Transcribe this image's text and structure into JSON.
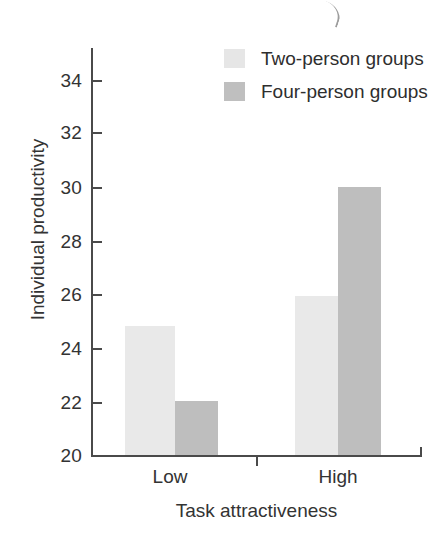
{
  "chart_data": {
    "type": "bar",
    "title": "",
    "xlabel": "Task attractiveness",
    "ylabel": "Individual productivity",
    "categories": [
      "Low",
      "High"
    ],
    "series": [
      {
        "name": "Two-person groups",
        "color": "#e9e9e9",
        "values": [
          24.8,
          25.95
        ]
      },
      {
        "name": "Four-person groups",
        "color": "#bebebe",
        "values": [
          22.0,
          30.0
        ]
      }
    ],
    "ylim": [
      20,
      35.2
    ],
    "yticks": [
      20,
      22,
      24,
      26,
      28,
      30,
      32,
      34
    ],
    "ytick_labels": [
      "20",
      "22",
      "24",
      "26",
      "28",
      "30",
      "32",
      "34"
    ],
    "grid": false,
    "legend_position": "top-right"
  },
  "legend": {
    "items": [
      {
        "label": "Two-person groups",
        "swatch": "light-gray-swatch"
      },
      {
        "label": "Four-person groups",
        "swatch": "medium-gray-swatch"
      }
    ]
  },
  "axes": {
    "y_title": "Individual productivity",
    "x_title": "Task attractiveness",
    "x_categories": [
      "Low",
      "High"
    ],
    "y_labels": [
      "34",
      "32",
      "30",
      "28",
      "26",
      "24",
      "22",
      "20"
    ]
  }
}
